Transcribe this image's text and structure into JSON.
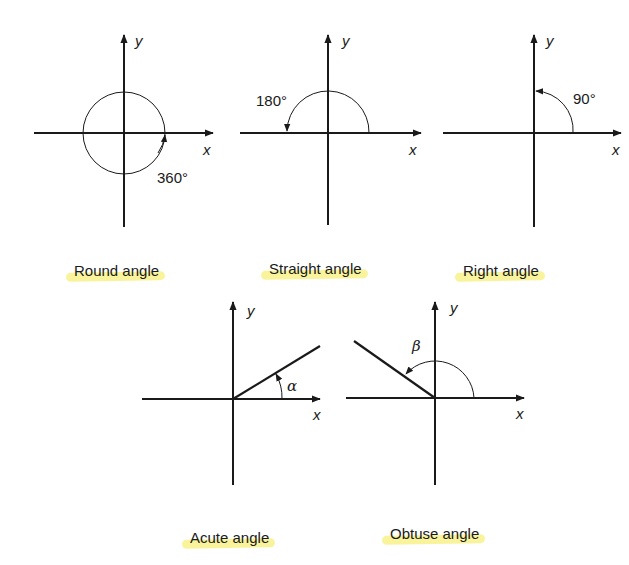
{
  "figure": {
    "panels": [
      {
        "id": "round",
        "caption": "Round angle",
        "angle_label": "360°",
        "x_label": "x",
        "y_label": "y"
      },
      {
        "id": "straight",
        "caption": "Straight angle",
        "angle_label": "180°",
        "x_label": "x",
        "y_label": "y"
      },
      {
        "id": "right",
        "caption": "Right angle",
        "angle_label": "90°",
        "x_label": "x",
        "y_label": "y"
      },
      {
        "id": "acute",
        "caption": "Acute angle",
        "angle_label": "α",
        "x_label": "x",
        "y_label": "y"
      },
      {
        "id": "obtuse",
        "caption": "Obtuse angle",
        "angle_label": "β",
        "x_label": "x",
        "y_label": "y"
      }
    ],
    "colors": {
      "ink": "#1a1a1a",
      "highlight": "#f7f07a",
      "background": "#ffffff"
    }
  }
}
